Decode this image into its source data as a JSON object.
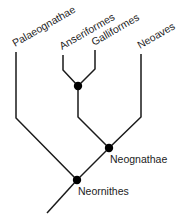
{
  "diagram": {
    "type": "phylogenetic-tree",
    "line_color": "#1a1a1a",
    "node_color": "#000000",
    "tips": [
      {
        "id": "palaeognathae",
        "label": "Palaeognathae"
      },
      {
        "id": "anseriformes",
        "label": "Anseriformes"
      },
      {
        "id": "galliformes",
        "label": "Galliformes"
      },
      {
        "id": "neoaves",
        "label": "Neoaves"
      }
    ],
    "internal_nodes": [
      {
        "id": "galloanserae",
        "label": ""
      },
      {
        "id": "neognathae",
        "label": "Neognathae"
      },
      {
        "id": "neornithes",
        "label": "Neornithes"
      }
    ],
    "edges": [
      {
        "from": "neornithes",
        "to": "palaeognathae"
      },
      {
        "from": "neornithes",
        "to": "neognathae"
      },
      {
        "from": "neognathae",
        "to": "galloanserae"
      },
      {
        "from": "neognathae",
        "to": "neoaves"
      },
      {
        "from": "galloanserae",
        "to": "anseriformes"
      },
      {
        "from": "galloanserae",
        "to": "galliformes"
      }
    ]
  }
}
